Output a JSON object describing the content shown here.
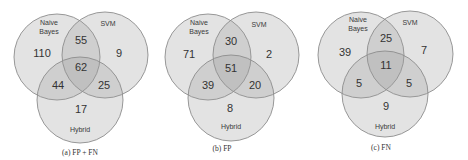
{
  "figure": {
    "panels": [
      {
        "caption": "(a) FP + FN",
        "sets": {
          "a": "Naive",
          "a2": "Bayes",
          "b": "SVM",
          "c": "Hybrid"
        },
        "regions": {
          "nb_only": "110",
          "nb_svm": "55",
          "svm_only": "9",
          "all": "62",
          "nb_hybrid": "44",
          "svm_hybrid": "25",
          "hybrid_only": "17"
        }
      },
      {
        "caption": "(b) FP",
        "sets": {
          "a": "Naive",
          "a2": "Bayes",
          "b": "SVM",
          "c": "Hybrid"
        },
        "regions": {
          "nb_only": "71",
          "nb_svm": "30",
          "svm_only": "2",
          "all": "51",
          "nb_hybrid": "39",
          "svm_hybrid": "20",
          "hybrid_only": "8"
        }
      },
      {
        "caption": "(c) FN",
        "sets": {
          "a": "Naive",
          "a2": "Bayes",
          "b": "SVM",
          "c": "Hybrid"
        },
        "regions": {
          "nb_only": "39",
          "nb_svm": "25",
          "svm_only": "7",
          "all": "11",
          "nb_hybrid": "5",
          "svm_hybrid": "5",
          "hybrid_only": "9"
        }
      }
    ],
    "colors": {
      "circle_fill": "#9a9a9a",
      "circle_stroke": "#8c8c8c",
      "text": "#333333",
      "background": "#ffffff"
    }
  }
}
